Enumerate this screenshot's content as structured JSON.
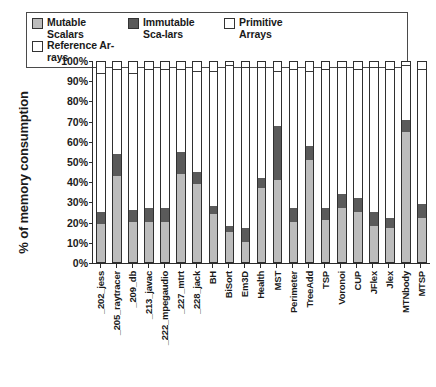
{
  "legend": {
    "entries": [
      {
        "label": "Mutable Scalars",
        "color": "#bcbcbc",
        "key": "mutable_scalars"
      },
      {
        "label": "Immutable Sca-lars",
        "color": "#5a5a5a",
        "key": "immutable_scalars"
      },
      {
        "label": "Primitive Arrays",
        "color": "#ffffff",
        "key": "primitive_arrays"
      },
      {
        "label": "Reference Ar-rays",
        "color": "#ffffff",
        "key": "reference_arrays"
      }
    ]
  },
  "chart_data": {
    "type": "bar",
    "stacked": true,
    "title": "",
    "xlabel": "",
    "ylabel": "% of memory consumption",
    "ylim": [
      0,
      100
    ],
    "ytick_labels": [
      "100%",
      "90%",
      "80%",
      "70%",
      "60%",
      "50%",
      "40%",
      "30%",
      "20%",
      "10%",
      "0%"
    ],
    "ytick_values": [
      100,
      90,
      80,
      70,
      60,
      50,
      40,
      30,
      20,
      10,
      0
    ],
    "grid": false,
    "legend_position": "top",
    "categories": [
      "_202_jess",
      "_205_raytracer",
      "_209_db",
      "_213_javac",
      "_222_mpegaudio",
      "_227_mtrt",
      "_228_jack",
      "BH",
      "BiSort",
      "Em3D",
      "Health",
      "MST",
      "Perimeter",
      "TreeAdd",
      "TSP",
      "Voronoi",
      "CUP",
      "JFlex",
      "Jlex",
      "MTNbody",
      "MTSP"
    ],
    "series": [
      {
        "name": "Mutable Scalars",
        "color": "#bcbcbc",
        "values": [
          19,
          43,
          20,
          20,
          20,
          44,
          39,
          24,
          15,
          10,
          37,
          41,
          20,
          51,
          21,
          27,
          25,
          18,
          17,
          65,
          22
        ]
      },
      {
        "name": "Immutable Scalars",
        "color": "#5a5a5a",
        "values": [
          6,
          11,
          6,
          7,
          7,
          11,
          6,
          4,
          3,
          7,
          5,
          27,
          7,
          7,
          6,
          7,
          7,
          7,
          5,
          6,
          7
        ]
      },
      {
        "name": "Primitive Arrays",
        "color": "#ffffff",
        "values": [
          69,
          42,
          68,
          69,
          69,
          41,
          50,
          67,
          80,
          80,
          55,
          27,
          69,
          37,
          69,
          63,
          64,
          72,
          74,
          27,
          67
        ]
      },
      {
        "name": "Reference Arrays",
        "color": "#ffffff",
        "values": [
          6,
          4,
          6,
          4,
          4,
          4,
          5,
          5,
          2,
          3,
          3,
          5,
          4,
          5,
          4,
          3,
          4,
          3,
          4,
          2,
          4
        ]
      }
    ]
  }
}
